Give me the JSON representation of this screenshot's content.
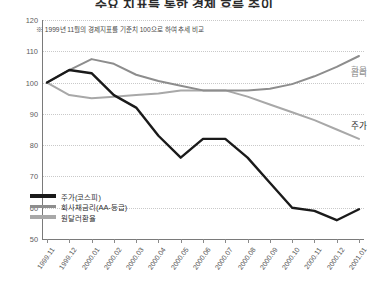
{
  "title": "주요 지표를 통한 경제 흐름 추이",
  "note": "※ 1999년 11월의 경제지표를 기준치 100으로 하여 추세 비교",
  "legend": [
    {
      "label": "주가(코스피)",
      "color": "#1a1a1a"
    },
    {
      "label": "회사채금리(AA-등급)",
      "color": "#8d8d8d"
    },
    {
      "label": "원달러환율",
      "color": "#a8a8a8"
    }
  ],
  "annotations": [
    {
      "name": "kospi",
      "text": "주가",
      "x": 2000.06,
      "y": 86.5
    },
    {
      "name": "rate",
      "text": "금리",
      "x": 2000.035,
      "y": 103.5
    },
    {
      "name": "fx",
      "text": "환율",
      "x": 2000.105,
      "y": 104.0
    }
  ],
  "chart_data": {
    "type": "line",
    "title": "주요 지표를 통한 경제 흐름 추이",
    "subtitle": "※ 1999년 11월의 경제지표를 기준치 100으로 하여 추세 비교",
    "xlabel": "",
    "ylabel": "",
    "ylim": [
      50,
      120
    ],
    "yticks": [
      50,
      60,
      70,
      80,
      90,
      100,
      110,
      120
    ],
    "grid": true,
    "legend_position": "bottom-left",
    "categories": [
      "1999.11",
      "1999.12",
      "2000.01",
      "2000.02",
      "2000.03",
      "2000.04",
      "2000.05",
      "2000.06",
      "2000.07",
      "2000.08",
      "2000.09",
      "2000.10",
      "2000.11",
      "2000.12",
      "2001.01"
    ],
    "series": [
      {
        "name": "주가(코스피)",
        "color": "#1a1a1a",
        "values": [
          100,
          104,
          103,
          96,
          92,
          83,
          76,
          82,
          82,
          76,
          68,
          60,
          59,
          56,
          59.5
        ]
      },
      {
        "name": "회사채금리(AA-등급)",
        "color": "#8d8d8d",
        "values": [
          100,
          104,
          107.5,
          106,
          102.5,
          100.5,
          99,
          97.5,
          97.5,
          97.5,
          98,
          99.5,
          102,
          105,
          108.5
        ]
      },
      {
        "name": "원달러환율",
        "color": "#a8a8a8",
        "values": [
          100,
          96,
          95,
          95.5,
          96,
          96.5,
          97.5,
          97.5,
          97.5,
          95.5,
          93,
          90.5,
          88,
          85,
          82
        ]
      }
    ]
  }
}
